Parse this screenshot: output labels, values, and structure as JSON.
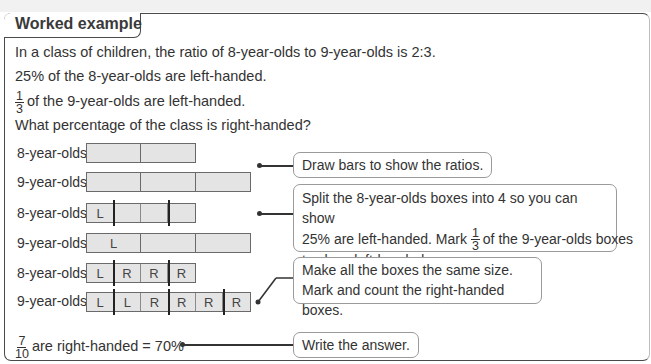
{
  "title": "Worked example",
  "problem": {
    "line1": "In a class of children, the ratio of 8-year-olds to 9-year-olds is 2:3.",
    "line2": "25% of the 8-year-olds are left-handed.",
    "line3_frac_num": "1",
    "line3_frac_den": "3",
    "line3": "of the 9-year-olds are left-handed.",
    "line4": "What percentage of the class is right-handed?"
  },
  "rows": [
    {
      "label": "8-year-olds",
      "cells": [
        "",
        ""
      ]
    },
    {
      "label": "9-year-olds",
      "cells": [
        "",
        "",
        ""
      ]
    },
    {
      "label": "8-year-olds",
      "cells": [
        "L",
        "",
        "",
        ""
      ]
    },
    {
      "label": "9-year-olds",
      "cells": [
        "L",
        "",
        ""
      ]
    },
    {
      "label": "8-year-olds",
      "cells": [
        "L",
        "R",
        "R",
        "R"
      ]
    },
    {
      "label": "9-year-olds",
      "cells": [
        "L",
        "L",
        "R",
        "R",
        "R",
        "R"
      ]
    }
  ],
  "callouts": {
    "step1": "Draw bars to show the ratios.",
    "step2_line1": "Split the 8-year-olds boxes into 4 so you can show",
    "step2_line2a": "25% are left-handed. Mark",
    "step2_frac_num": "1",
    "step2_frac_den": "3",
    "step2_line2b": "of the 9-year-olds boxes",
    "step2_line3": "to show left-handed.",
    "step3_line1": "Make all the boxes the same size.",
    "step3_line2": "Mark and count the right-handed boxes.",
    "step4": "Write the answer."
  },
  "answer": {
    "frac_num": "7",
    "frac_den": "10",
    "text": "are right-handed = 70%"
  }
}
